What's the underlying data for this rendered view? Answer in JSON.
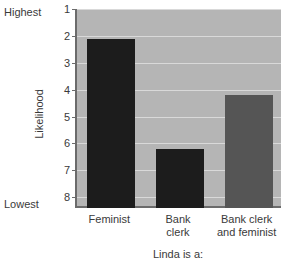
{
  "chart_data": {
    "type": "bar",
    "title": "",
    "xlabel": "Linda is a:",
    "ylabel": "Likelihood",
    "categories": [
      "Feminist",
      "Bank\nclerk",
      "Bank clerk\nand feminist"
    ],
    "values": [
      2.1,
      6.2,
      4.2
    ],
    "bar_colors": [
      "#1c1c1c",
      "#1c1c1c",
      "#555555"
    ],
    "yaxis": {
      "tick_labels": [
        "1",
        "2",
        "3",
        "4",
        "5",
        "6",
        "7",
        "8"
      ],
      "tick_values": [
        1,
        2,
        3,
        4,
        5,
        6,
        7,
        8
      ],
      "inverted": true,
      "ylim": [
        1,
        8.4
      ],
      "top_annotation": "Highest",
      "bottom_annotation": "Lowest"
    },
    "grid": true,
    "legend": false,
    "plot_background": "#b5b5b5",
    "gridline_color": "#d9d9d9",
    "axis_color": "#6b6b6b",
    "text_color": "#3a3a3a"
  }
}
